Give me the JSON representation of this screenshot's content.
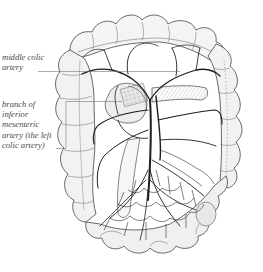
{
  "figure": {
    "labels": [
      {
        "id": "middle-colic-artery",
        "lines": [
          "middle colic",
          "artery"
        ]
      },
      {
        "id": "left-colic-artery",
        "lines": [
          "branch of",
          "inferior",
          "mesenteric",
          "artery (the left",
          "colic artery)"
        ]
      }
    ],
    "colors": {
      "background": "#ffffff",
      "ink": "#222222",
      "label_text": "#4a4a4a",
      "leader_line": "#777777"
    }
  }
}
